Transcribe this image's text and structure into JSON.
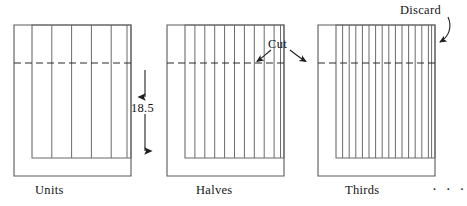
{
  "figure": {
    "type": "technical-diagram",
    "background_color": "#ffffff",
    "line_color": "#4a4a4a",
    "dash_color": "#2b2b2b"
  },
  "panels": [
    {
      "id": "units",
      "label": "Units",
      "strip_count": 5,
      "outer": {
        "x": 14,
        "y": 25,
        "width": 117,
        "height": 151
      },
      "inner": {
        "x": 32,
        "y": 25,
        "width": 99,
        "height": 133
      }
    },
    {
      "id": "halves",
      "label": "Halves",
      "strip_count": 10,
      "outer": {
        "x": 167,
        "y": 25,
        "width": 117,
        "height": 151
      },
      "inner": {
        "x": 185,
        "y": 25,
        "width": 99,
        "height": 133
      }
    },
    {
      "id": "thirds",
      "label": "Thirds",
      "strip_count": 15,
      "outer": {
        "x": 318,
        "y": 25,
        "width": 117,
        "height": 151
      },
      "inner": {
        "x": 336,
        "y": 25,
        "width": 99,
        "height": 133
      }
    }
  ],
  "annotations": {
    "dimension": {
      "value": "18.5",
      "orientation": "vertical",
      "arrow": "double-headed",
      "from_y": 63,
      "to_y": 158,
      "at_x": 145
    },
    "cut": {
      "label": "Cut",
      "arrows": 2,
      "points_to": [
        "halves-dashed-line",
        "thirds-dashed-line"
      ],
      "dashed_line_y": 63
    },
    "discard": {
      "label": "Discard",
      "arrows": 1,
      "points_to": "thirds-rightmost-remnant-strip"
    },
    "continuation": {
      "label": "· · ·",
      "meaning": "sequence continues"
    }
  }
}
